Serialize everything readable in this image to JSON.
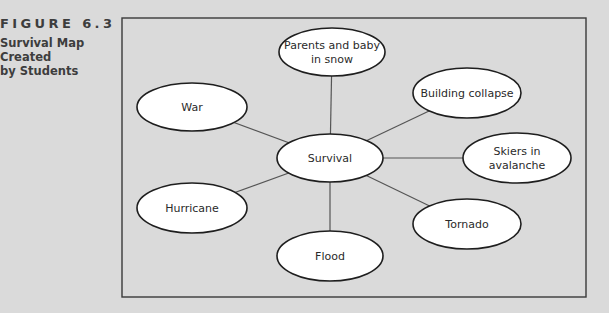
{
  "caption": {
    "label": "FIGURE 6.3",
    "title": "Survival Map\nCreated\nby Students"
  },
  "colors": {
    "background": "#dadada",
    "frame": "#3a3a3a",
    "node_fill": "#ffffff",
    "node_stroke": "#1e1e1e",
    "edge": "#555555",
    "text": "#2a2a2a"
  },
  "diagram": {
    "frame": {
      "x": 122,
      "y": 18,
      "width": 464,
      "height": 279
    },
    "center": "survival",
    "nodes": [
      {
        "id": "survival",
        "lines": [
          "Survival"
        ],
        "cx": 330,
        "cy": 158,
        "rx": 53,
        "ry": 24
      },
      {
        "id": "parents",
        "lines": [
          "Parents and baby",
          "in snow"
        ],
        "cx": 332,
        "cy": 52,
        "rx": 53,
        "ry": 24
      },
      {
        "id": "building",
        "lines": [
          "Building collapse"
        ],
        "cx": 467,
        "cy": 93,
        "rx": 54,
        "ry": 25
      },
      {
        "id": "skiers",
        "lines": [
          "Skiers in",
          "avalanche"
        ],
        "cx": 517,
        "cy": 158,
        "rx": 54,
        "ry": 25
      },
      {
        "id": "tornado",
        "lines": [
          "Tornado"
        ],
        "cx": 467,
        "cy": 224,
        "rx": 54,
        "ry": 25
      },
      {
        "id": "flood",
        "lines": [
          "Flood"
        ],
        "cx": 330,
        "cy": 256,
        "rx": 53,
        "ry": 25
      },
      {
        "id": "hurricane",
        "lines": [
          "Hurricane"
        ],
        "cx": 192,
        "cy": 208,
        "rx": 55,
        "ry": 25
      },
      {
        "id": "war",
        "lines": [
          "War"
        ],
        "cx": 192,
        "cy": 107,
        "rx": 55,
        "ry": 24
      }
    ],
    "edges": [
      [
        "survival",
        "parents"
      ],
      [
        "survival",
        "building"
      ],
      [
        "survival",
        "skiers"
      ],
      [
        "survival",
        "tornado"
      ],
      [
        "survival",
        "flood"
      ],
      [
        "survival",
        "hurricane"
      ],
      [
        "survival",
        "war"
      ]
    ]
  }
}
